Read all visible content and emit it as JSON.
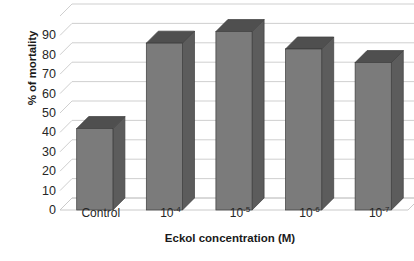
{
  "chart_data": {
    "type": "bar",
    "title": "",
    "subtitle": "",
    "xlabel": "Eckol concentration (M)",
    "ylabel": "% of mortality",
    "categories": [
      "Control",
      "10-4",
      "10-5",
      "10-6",
      "10-7"
    ],
    "category_labels_display": [
      {
        "base": "Control",
        "exp": ""
      },
      {
        "base": "10",
        "exp": "-4"
      },
      {
        "base": "10",
        "exp": "-5"
      },
      {
        "base": "10",
        "exp": "-6"
      },
      {
        "base": "10",
        "exp": "-7"
      }
    ],
    "values": [
      42,
      86,
      92,
      83,
      76
    ],
    "ylim": [
      0,
      100
    ],
    "ytick_values": [
      0,
      10,
      20,
      30,
      40,
      50,
      60,
      70,
      80,
      90
    ],
    "ytick_labels": [
      "0",
      "10",
      "20",
      "30",
      "40",
      "50",
      "60",
      "70",
      "80",
      "90"
    ],
    "grid": true,
    "grid_axis": "y",
    "legend": "none",
    "style": "3d-column",
    "series": [
      {
        "name": "% of mortality",
        "values": [
          42,
          86,
          92,
          83,
          76
        ]
      }
    ]
  },
  "colors": {
    "bar_front": "#7b7b7b",
    "bar_side": "#5c5c5c",
    "bar_top": "#4f4f4f",
    "bar_outline": "#3d3d3d",
    "gridline": "#c9c9c9",
    "wall_edge": "#bdbdbd",
    "text": "#262626",
    "title_text": "#1a1a1a",
    "background": "#ffffff"
  },
  "artifacts": {
    "top_edge_text": "·  ·   ·      ·"
  }
}
